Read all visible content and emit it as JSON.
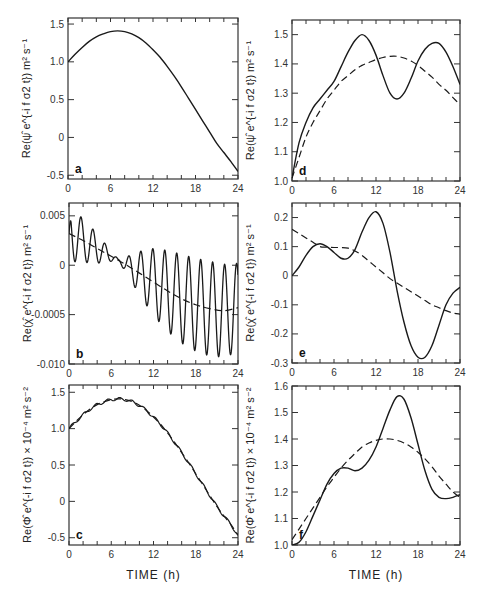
{
  "figure": {
    "xlabel": "TIME (h)",
    "line_color": "#1a1a1a",
    "frame_color": "#333333"
  },
  "chart_data": [
    {
      "panel": "a",
      "type": "line",
      "title": "",
      "xlabel": "",
      "ylabel": "Re(ψ̂ e^{-i f σ2 t}) m² s⁻¹",
      "xlim": [
        0,
        24
      ],
      "ylim": [
        -0.55,
        1.58
      ],
      "xticks": [
        0,
        6,
        12,
        18,
        24
      ],
      "yticks": [
        -0.5,
        0,
        0.5,
        1.0,
        1.5
      ],
      "ytick_labels": [
        "-0.5",
        "0",
        "0.5",
        "1.0",
        "1.5"
      ],
      "series": [
        {
          "name": "solid",
          "style": "solid",
          "x": [
            0,
            1,
            2,
            3,
            4,
            5,
            6,
            7,
            8,
            9,
            10,
            11,
            12,
            13,
            14,
            15,
            16,
            17,
            18,
            19,
            20,
            21,
            22,
            23,
            24
          ],
          "y": [
            1.0,
            1.1,
            1.19,
            1.27,
            1.33,
            1.37,
            1.4,
            1.41,
            1.4,
            1.37,
            1.32,
            1.25,
            1.16,
            1.06,
            0.94,
            0.81,
            0.67,
            0.52,
            0.37,
            0.22,
            0.07,
            -0.08,
            -0.2,
            -0.32,
            -0.45
          ]
        }
      ]
    },
    {
      "panel": "d",
      "type": "line",
      "ylabel": "Re(ψ̂ e^{-i f σ2 t}) m² s⁻¹",
      "xlim": [
        0,
        24
      ],
      "ylim": [
        1.0,
        1.55
      ],
      "xticks": [
        0,
        6,
        12,
        18,
        24
      ],
      "yticks": [
        1.0,
        1.1,
        1.2,
        1.3,
        1.4,
        1.5
      ],
      "ytick_labels": [
        "1.0",
        "1.1",
        "1.2",
        "1.3",
        "1.4",
        "1.5"
      ],
      "series": [
        {
          "name": "solid",
          "style": "solid",
          "x": [
            0,
            1,
            2,
            3,
            4,
            5,
            6,
            7,
            8,
            9,
            10,
            11,
            12,
            13,
            14,
            15,
            16,
            17,
            18,
            19,
            20,
            21,
            22,
            23,
            24
          ],
          "y": [
            1.01,
            1.13,
            1.2,
            1.25,
            1.28,
            1.31,
            1.34,
            1.39,
            1.44,
            1.48,
            1.5,
            1.48,
            1.43,
            1.36,
            1.3,
            1.28,
            1.3,
            1.35,
            1.41,
            1.45,
            1.47,
            1.47,
            1.44,
            1.39,
            1.33
          ]
        },
        {
          "name": "dashed",
          "style": "dashed",
          "x": [
            0,
            1,
            2,
            3,
            4,
            5,
            6,
            7,
            8,
            9,
            10,
            11,
            12,
            13,
            14,
            15,
            16,
            17,
            18,
            19,
            20,
            21,
            22,
            23,
            24
          ],
          "y": [
            1.01,
            1.08,
            1.15,
            1.2,
            1.24,
            1.28,
            1.31,
            1.34,
            1.36,
            1.38,
            1.395,
            1.405,
            1.415,
            1.422,
            1.426,
            1.426,
            1.42,
            1.41,
            1.395,
            1.375,
            1.355,
            1.33,
            1.31,
            1.285,
            1.26
          ]
        }
      ]
    },
    {
      "panel": "b",
      "type": "line",
      "ylabel": "Re(χ̂ e^{-i f σ2 t}) m² s⁻¹",
      "xlim": [
        0,
        24
      ],
      "ylim": [
        -0.01,
        0.0063
      ],
      "xticks": [
        0,
        6,
        12,
        18,
        24
      ],
      "yticks": [
        -0.01,
        -0.005,
        0,
        0.005
      ],
      "ytick_labels": [
        "-0.010",
        "-0.0005",
        "0",
        "0.005"
      ],
      "series": [
        {
          "name": "solid (oscillating)",
          "style": "solid",
          "generator": "osc",
          "description": "Inertial oscillation (~1.7 h period) about dashed mean; amplitude decays to ~0 near t≈7 h then grows; minima reach ≈-0.0092 near t≈20–22 h",
          "mean_x": [
            0,
            2,
            4,
            6,
            8,
            10,
            12,
            14,
            16,
            18,
            20,
            22,
            24
          ],
          "mean_y": [
            0.0032,
            0.0025,
            0.0017,
            0.0009,
            0.0001,
            -0.0008,
            -0.0017,
            -0.0026,
            -0.0034,
            -0.004,
            -0.0044,
            -0.0046,
            -0.0043
          ],
          "amp_x": [
            0,
            2,
            4,
            6,
            7,
            8,
            10,
            12,
            14,
            16,
            18,
            20,
            22,
            24
          ],
          "amp_y": [
            0.0028,
            0.0022,
            0.0015,
            0.0005,
            0.0001,
            0.0007,
            0.0022,
            0.0034,
            0.0041,
            0.0045,
            0.0047,
            0.0048,
            0.0047,
            0.0045
          ],
          "period": 1.7
        },
        {
          "name": "dashed",
          "style": "dashed",
          "x": [
            0,
            2,
            4,
            6,
            8,
            10,
            12,
            14,
            16,
            18,
            20,
            22,
            24
          ],
          "y": [
            0.0032,
            0.0025,
            0.0017,
            0.0009,
            0.0001,
            -0.0008,
            -0.0017,
            -0.0026,
            -0.0034,
            -0.004,
            -0.0044,
            -0.0046,
            -0.0043
          ]
        }
      ]
    },
    {
      "panel": "e",
      "type": "line",
      "ylabel": "Re(χ̂ e^{-i f σ2 t}) m² s⁻¹",
      "xlim": [
        0,
        24
      ],
      "ylim": [
        -0.3,
        0.25
      ],
      "xticks": [
        0,
        6,
        12,
        18,
        24
      ],
      "yticks": [
        -0.3,
        -0.2,
        -0.1,
        0,
        0.1,
        0.2
      ],
      "ytick_labels": [
        "-0.3",
        "-0.2",
        "-0.1",
        "0",
        "0.1",
        "0.2"
      ],
      "series": [
        {
          "name": "solid",
          "style": "solid",
          "x": [
            0,
            1,
            2,
            3,
            4,
            5,
            6,
            7,
            8,
            9,
            10,
            11,
            12,
            13,
            14,
            15,
            16,
            17,
            18,
            19,
            20,
            21,
            22,
            23,
            24
          ],
          "y": [
            0.0,
            0.03,
            0.07,
            0.1,
            0.11,
            0.1,
            0.08,
            0.06,
            0.06,
            0.09,
            0.15,
            0.2,
            0.22,
            0.18,
            0.08,
            -0.05,
            -0.16,
            -0.24,
            -0.28,
            -0.28,
            -0.24,
            -0.17,
            -0.1,
            -0.06,
            -0.04
          ]
        },
        {
          "name": "dashed",
          "style": "dashed",
          "x": [
            0,
            1,
            2,
            3,
            4,
            5,
            6,
            7,
            8,
            9,
            10,
            11,
            12,
            13,
            14,
            15,
            16,
            17,
            18,
            19,
            20,
            21,
            22,
            23,
            24
          ],
          "y": [
            0.16,
            0.145,
            0.13,
            0.115,
            0.1,
            0.098,
            0.097,
            0.097,
            0.095,
            0.085,
            0.07,
            0.05,
            0.03,
            0.01,
            -0.01,
            -0.025,
            -0.04,
            -0.055,
            -0.07,
            -0.085,
            -0.1,
            -0.11,
            -0.12,
            -0.128,
            -0.132
          ]
        }
      ]
    },
    {
      "panel": "c",
      "type": "line",
      "xlabel": "TIME (h)",
      "ylabel": "Re(Φ̂ e^{-i f σ2 t}) × 10⁻⁴ m² s⁻²",
      "xlim": [
        0,
        24
      ],
      "ylim": [
        -0.6,
        1.6
      ],
      "xticks": [
        0,
        6,
        12,
        18,
        24
      ],
      "yticks": [
        -0.5,
        0,
        0.5,
        1.0,
        1.5
      ],
      "ytick_labels": [
        "-0.5",
        "0",
        "0.5",
        "1.0",
        "1.5"
      ],
      "series": [
        {
          "name": "solid (small ripples)",
          "style": "solid",
          "ripple": 0.02,
          "x": [
            0,
            1,
            2,
            3,
            4,
            5,
            6,
            7,
            8,
            9,
            10,
            11,
            12,
            13,
            14,
            15,
            16,
            17,
            18,
            19,
            20,
            21,
            22,
            23,
            24
          ],
          "y": [
            1.0,
            1.1,
            1.19,
            1.27,
            1.33,
            1.37,
            1.4,
            1.41,
            1.4,
            1.37,
            1.32,
            1.25,
            1.16,
            1.06,
            0.94,
            0.81,
            0.67,
            0.53,
            0.38,
            0.23,
            0.08,
            -0.07,
            -0.2,
            -0.32,
            -0.47
          ]
        },
        {
          "name": "dashed",
          "style": "dashed",
          "x": [
            0,
            1,
            2,
            3,
            4,
            5,
            6,
            7,
            8,
            9,
            10,
            11,
            12,
            13,
            14,
            15,
            16,
            17,
            18,
            19,
            20,
            21,
            22,
            23,
            24
          ],
          "y": [
            1.0,
            1.1,
            1.19,
            1.27,
            1.33,
            1.37,
            1.4,
            1.41,
            1.4,
            1.37,
            1.32,
            1.25,
            1.16,
            1.06,
            0.94,
            0.81,
            0.67,
            0.53,
            0.38,
            0.23,
            0.08,
            -0.07,
            -0.2,
            -0.32,
            -0.47
          ]
        }
      ]
    },
    {
      "panel": "f",
      "type": "line",
      "xlabel": "TIME (h)",
      "ylabel": "Re(Φ̂ e^{-i f σ2 t}) × 10⁻⁴ m² s⁻²",
      "xlim": [
        0,
        24
      ],
      "ylim": [
        1.0,
        1.6
      ],
      "xticks": [
        0,
        6,
        12,
        18,
        24
      ],
      "yticks": [
        1.0,
        1.1,
        1.2,
        1.3,
        1.4,
        1.5,
        1.6
      ],
      "ytick_labels": [
        "1.0",
        "1.1",
        "1.2",
        "1.3",
        "1.4",
        "1.5",
        "1.6"
      ],
      "series": [
        {
          "name": "solid",
          "style": "solid",
          "x": [
            0,
            1,
            2,
            3,
            4,
            5,
            6,
            7,
            8,
            9,
            10,
            11,
            12,
            13,
            14,
            15,
            16,
            17,
            18,
            19,
            20,
            21,
            22,
            23,
            24
          ],
          "y": [
            1.0,
            1.01,
            1.05,
            1.11,
            1.17,
            1.23,
            1.27,
            1.29,
            1.29,
            1.28,
            1.29,
            1.32,
            1.37,
            1.44,
            1.51,
            1.56,
            1.55,
            1.48,
            1.38,
            1.28,
            1.21,
            1.18,
            1.175,
            1.18,
            1.19
          ]
        },
        {
          "name": "dashed",
          "style": "dashed",
          "x": [
            0,
            1,
            2,
            3,
            4,
            5,
            6,
            7,
            8,
            9,
            10,
            11,
            12,
            13,
            14,
            15,
            16,
            17,
            18,
            19,
            20,
            21,
            22,
            23,
            24
          ],
          "y": [
            1.02,
            1.06,
            1.1,
            1.14,
            1.18,
            1.22,
            1.255,
            1.29,
            1.32,
            1.345,
            1.37,
            1.385,
            1.395,
            1.4,
            1.4,
            1.395,
            1.385,
            1.37,
            1.35,
            1.325,
            1.295,
            1.26,
            1.23,
            1.2,
            1.18
          ]
        }
      ]
    }
  ],
  "panels_layout": [
    {
      "panel": "a",
      "box": [
        68,
        18,
        238,
        179
      ],
      "label_pos": "bottom-left"
    },
    {
      "panel": "d",
      "box": [
        292,
        20,
        460,
        181
      ],
      "label_pos": "bottom-left"
    },
    {
      "panel": "b",
      "box": [
        69,
        203,
        238,
        364
      ],
      "label_pos": "bottom-left"
    },
    {
      "panel": "e",
      "box": [
        292,
        203,
        460,
        363
      ],
      "label_pos": "bottom-left"
    },
    {
      "panel": "c",
      "box": [
        69,
        385,
        238,
        545
      ],
      "label_pos": "bottom-left"
    },
    {
      "panel": "f",
      "box": [
        292,
        386,
        460,
        545
      ],
      "label_pos": "bottom-left"
    }
  ]
}
